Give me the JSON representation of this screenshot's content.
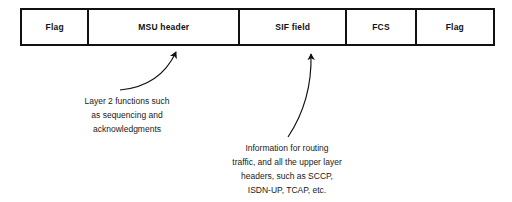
{
  "diagram": {
    "type": "packet-frame-structure",
    "packet": {
      "fields": [
        {
          "label": "Flag"
        },
        {
          "label": "MSU header"
        },
        {
          "label": "SIF field"
        },
        {
          "label": "FCS"
        },
        {
          "label": "Flag"
        }
      ]
    },
    "annotations": [
      {
        "id": "msu-header-note",
        "points_to": "MSU header",
        "lines": [
          "Layer 2 functions such",
          "as sequencing and",
          "acknowledgments"
        ]
      },
      {
        "id": "sif-field-note",
        "points_to": "SIF field",
        "lines": [
          "Information for routing",
          "traffic, and all the upper layer",
          "headers, such as SCCP,",
          "ISDN-UP, TCAP, etc."
        ]
      }
    ],
    "colors": {
      "stroke": "#111111",
      "text": "#1a1a1a",
      "background": "#ffffff"
    }
  }
}
